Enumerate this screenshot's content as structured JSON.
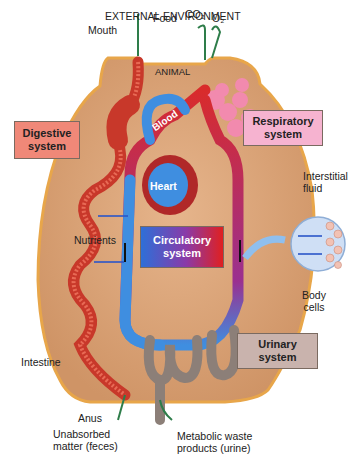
{
  "diagram": {
    "header": "EXTERNAL ENVIRONMENT",
    "region_label": "ANIMAL",
    "inputs": {
      "food": "Food",
      "co2": "CO₂",
      "o2": "O₂"
    },
    "labels": {
      "mouth": "Mouth",
      "interstitial_fluid": [
        "Interstitial",
        "fluid"
      ],
      "body_cells": [
        "Body",
        "cells"
      ],
      "nutrients": "Nutrients",
      "intestine": "Intestine",
      "anus": "Anus",
      "feces": [
        "Unabsorbed",
        "matter (feces)"
      ],
      "urine": [
        "Metabolic waste",
        "products (urine)"
      ],
      "blood": "Blood",
      "heart": "Heart"
    },
    "systems": [
      {
        "name": [
          "Digestive",
          "system"
        ],
        "color": "#f08878"
      },
      {
        "name": [
          "Respiratory",
          "system"
        ],
        "color": "#f6b3d0"
      },
      {
        "name": [
          "Circulatory",
          "system"
        ],
        "color_from": "#2e6fd8",
        "color_to": "#e02020"
      },
      {
        "name": [
          "Urinary",
          "system"
        ],
        "color": "#c9b3ad"
      }
    ],
    "colors": {
      "body": "#d9a57a",
      "outline": "#e8a64a",
      "arrow": "#2e7d4a",
      "blood_blue": "#3f8ee0",
      "blood_red": "#d92b2b"
    }
  }
}
